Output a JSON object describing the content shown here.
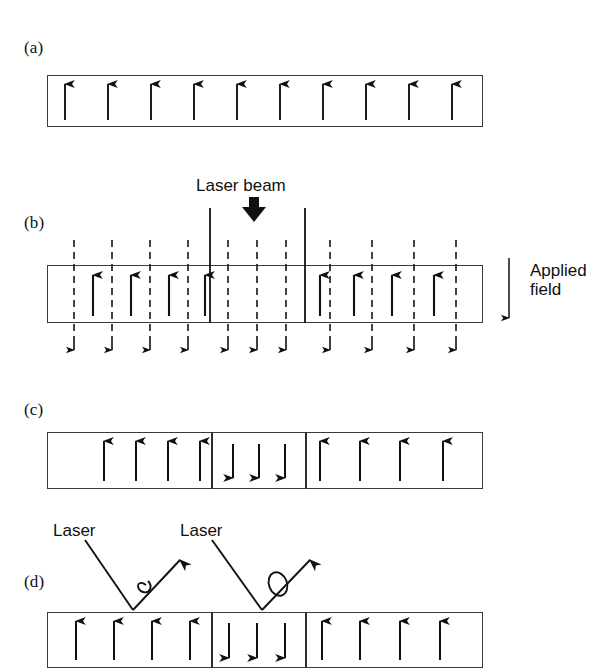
{
  "figure": {
    "background_color": "#ffffff",
    "ink_color": "#111111"
  },
  "panels": [
    {
      "id": "a",
      "label": "(a)",
      "caption_role": "uniform initial magnetization",
      "slab": {
        "x": 47,
        "y": 75,
        "width": 436,
        "height": 52
      },
      "up_arrows": 10,
      "down_arrows": 0,
      "dividers": []
    },
    {
      "id": "b",
      "label": "(b)",
      "caption_role": "laser heating with applied reverse field",
      "slab": {
        "x": 47,
        "y": 265,
        "width": 436,
        "height": 58
      },
      "up_arrows_left": 4,
      "up_arrows_right": 4,
      "up_arrows_center": 0,
      "dashed_field_lines": 11,
      "dividers": [
        210,
        305
      ]
    },
    {
      "id": "c",
      "label": "(c)",
      "caption_role": "reversed magnetic domain written",
      "slab": {
        "x": 47,
        "y": 432,
        "width": 436,
        "height": 57
      },
      "up_arrows_left": 4,
      "down_arrows_center": 3,
      "up_arrows_right": 4,
      "dividers": [
        211,
        305
      ]
    },
    {
      "id": "d",
      "label": "(d)",
      "caption_role": "readout by Kerr rotation of reflected laser",
      "slab": {
        "x": 47,
        "y": 612,
        "width": 436,
        "height": 56
      },
      "up_arrows_left": 4,
      "down_arrows_center": 3,
      "up_arrows_right": 4,
      "dividers": [
        211,
        305
      ]
    }
  ],
  "labels": {
    "laser_beam": "Laser beam",
    "applied_field_line1": "Applied",
    "applied_field_line2": "field",
    "laser_left": "Laser",
    "laser_right": "Laser"
  },
  "annotations": {
    "laser_beam_arrow": "thick-down-arrow",
    "applied_field_arrow": "thin-down-arrow",
    "incident_ray_left": "laser-incident-ray",
    "reflected_ray_left": "laser-reflected-ray",
    "rotation_symbol_left": "polarization-rotation-curl",
    "incident_ray_right": "laser-incident-ray",
    "reflected_ray_right": "laser-reflected-ray",
    "rotation_symbol_right": "polarization-rotation-loop"
  }
}
